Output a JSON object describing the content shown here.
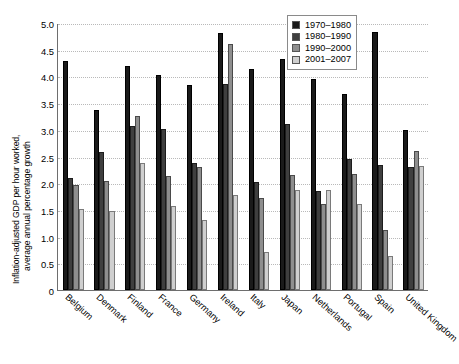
{
  "chart_data": {
    "type": "bar",
    "title": "",
    "xlabel": "",
    "ylabel": "Inflation-adjusted GDP per hour worked, average annual percentage growth",
    "ylabel_line1": "Inflation-adjusted GDP per hour worked,",
    "ylabel_line2": "average annual percentage growth",
    "ylim": [
      0,
      5.0
    ],
    "ytick_step": 0.5,
    "ytick_labels": [
      "5.0",
      "4.5",
      "4.0",
      "3.5",
      "3.0",
      "2.5",
      "2.0",
      "1.5",
      "1.0",
      "0.5",
      "0"
    ],
    "ytick_values": [
      5.0,
      4.5,
      4.0,
      3.5,
      3.0,
      2.5,
      2.0,
      1.5,
      1.0,
      0.5,
      0
    ],
    "grid": true,
    "grid_axis": "y",
    "legend_position": "top-right",
    "categories": [
      "Belgium",
      "Denmark",
      "Finland",
      "France",
      "Germany",
      "Ireland",
      "Italy",
      "Japan",
      "Netherlands",
      "Portugal",
      "Spain",
      "United Kingdom"
    ],
    "series": [
      {
        "name": "1970–1980",
        "color": "#1a1a1a",
        "values": [
          4.28,
          3.38,
          4.2,
          4.03,
          3.83,
          4.82,
          4.14,
          4.32,
          3.95,
          3.68,
          4.83,
          3.0
        ]
      },
      {
        "name": "1980–1990",
        "color": "#3f3f3f",
        "values": [
          2.1,
          2.58,
          3.08,
          3.02,
          2.38,
          3.85,
          2.02,
          3.1,
          1.85,
          2.45,
          2.35,
          2.3
        ]
      },
      {
        "name": "1990–2000",
        "color": "#8e8e8e",
        "values": [
          1.97,
          2.05,
          3.25,
          2.13,
          2.3,
          4.6,
          1.72,
          2.15,
          1.62,
          2.18,
          1.13,
          2.6
        ]
      },
      {
        "name": "2001–2007",
        "color": "#cfcfcf",
        "values": [
          1.51,
          1.48,
          2.38,
          1.57,
          1.32,
          1.78,
          0.72,
          1.88,
          1.87,
          1.62,
          0.63,
          2.32
        ]
      }
    ]
  }
}
